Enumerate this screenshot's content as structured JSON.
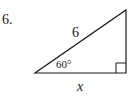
{
  "problem": {
    "number": "6."
  },
  "triangle": {
    "type": "right-triangle",
    "vertices": {
      "angle_vertex": [
        35,
        73
      ],
      "right_angle_vertex": [
        126,
        73
      ],
      "top_vertex": [
        126,
        10
      ]
    },
    "hypotenuse_label": "6",
    "angle_label": "60°",
    "base_label": "x",
    "right_angle_marker": true
  },
  "colors": {
    "stroke": "#1a1a1a",
    "background": "#ffffff"
  }
}
